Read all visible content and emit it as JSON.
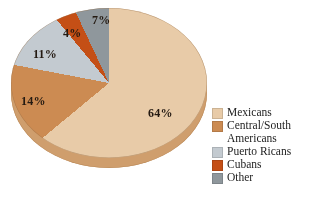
{
  "chart_data": {
    "type": "pie",
    "title": "",
    "subtitle": "",
    "xlabel": "",
    "ylabel": "",
    "categories": [
      "Mexicans",
      "Central/South Americans",
      "Puerto Ricans",
      "Cubans",
      "Other"
    ],
    "values": [
      64,
      14,
      11,
      4,
      7
    ],
    "value_unit": "%",
    "data_labels": [
      "64%",
      "14%",
      "11%",
      "4%",
      "7%"
    ],
    "colors": [
      "#e8cba8",
      "#cc8b52",
      "#c3cad0",
      "#c44f16",
      "#8f979c"
    ],
    "legend_position": "right",
    "grid": false,
    "three_d": true,
    "exploded_slice": "Mexicans",
    "slices": [
      {
        "label": "Mexicans",
        "value": 64,
        "display": "64%",
        "color": "#e8cba8"
      },
      {
        "label": "Central/South Americans",
        "value": 14,
        "display": "14%",
        "color": "#cc8b52"
      },
      {
        "label": "Puerto Ricans",
        "value": 11,
        "display": "11%",
        "color": "#c3cad0"
      },
      {
        "label": "Cubans",
        "value": 4,
        "display": "4%",
        "color": "#c44f16"
      },
      {
        "label": "Other",
        "value": 7,
        "display": "7%",
        "color": "#8f979c"
      }
    ]
  },
  "labels": {
    "mexicans_pct": "64%",
    "central_south_pct": "14%",
    "puerto_ricans_pct": "11%",
    "cubans_pct": "4%",
    "other_pct": "7%"
  },
  "legend": {
    "items": [
      {
        "label": "Mexicans",
        "color": "#e8cba8"
      },
      {
        "label": "Central/South\nAmericans",
        "color": "#cc8b52"
      },
      {
        "label": "Puerto Ricans",
        "color": "#c3cad0"
      },
      {
        "label": "Cubans",
        "color": "#c44f16"
      },
      {
        "label": "Other",
        "color": "#8f979c"
      }
    ]
  },
  "theme": {
    "background": "#ffffff",
    "text": "#1d1d1d",
    "pie_wall": "#cf9e6d",
    "pie_wall_shadow": "#bb8a59"
  }
}
